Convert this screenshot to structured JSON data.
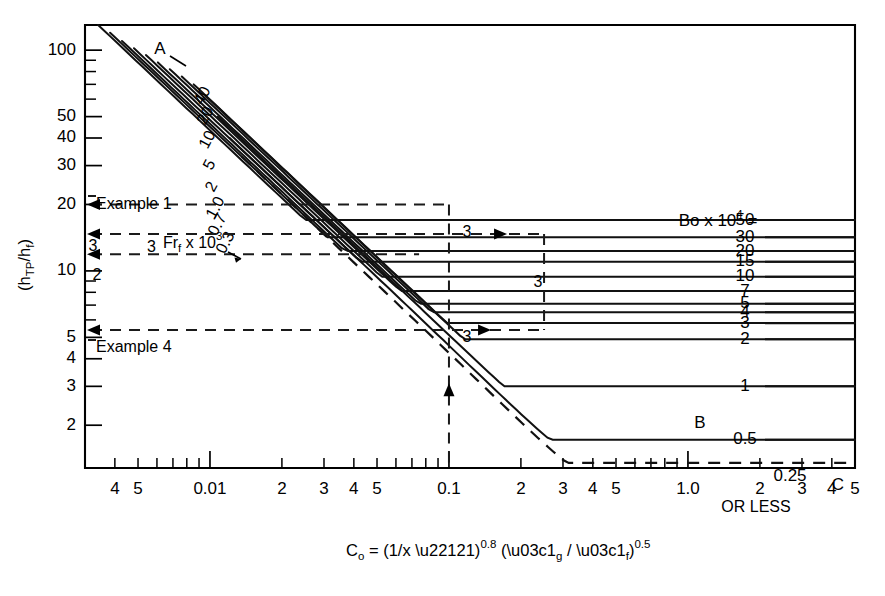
{
  "chart_data": {
    "type": "line",
    "title": "",
    "xlabel": "Cₒ = (1/x −1)⁰·⁸ (ρg / ρf)⁰·⁵",
    "ylabel": "(hTP/hf)",
    "xscale": "log",
    "yscale": "log",
    "xlim": [
      0.003,
      5.0
    ],
    "ylim": [
      1.28,
      130
    ],
    "grid": false,
    "legend_position": "inline-right",
    "x_tick_labels": [
      "4",
      "5",
      "0.01",
      "2",
      "3",
      "4",
      "5",
      "0.1",
      "2",
      "3",
      "4",
      "5",
      "1.0",
      "2",
      "3",
      "4",
      "5"
    ],
    "x_tick_values": [
      0.004,
      0.005,
      0.01,
      0.02,
      0.03,
      0.04,
      0.05,
      0.1,
      0.2,
      0.3,
      0.4,
      0.5,
      1.0,
      2.0,
      3.0,
      4.0,
      5.0
    ],
    "y_tick_labels": [
      "100",
      "50",
      "40",
      "30",
      "20",
      "10",
      "5",
      "4",
      "3",
      "2"
    ],
    "y_tick_values": [
      100,
      50,
      40,
      30,
      20,
      10,
      5,
      4,
      3,
      2
    ],
    "legend_title": "Bo x 10⁴ =",
    "series": [
      {
        "name": "50",
        "label": "50",
        "bo": 50,
        "y_at_left": 130,
        "y_right": 17.0
      },
      {
        "name": "30",
        "label": "30",
        "bo": 30,
        "y_at_left": 120,
        "y_right": 14.2
      },
      {
        "name": "20",
        "label": "20",
        "bo": 20,
        "y_at_left": 110,
        "y_right": 12.3
      },
      {
        "name": "15",
        "label": "15",
        "bo": 15,
        "y_at_left": 102,
        "y_right": 11.0
      },
      {
        "name": "10",
        "label": "10",
        "bo": 10,
        "y_at_left": 95,
        "y_right": 9.4
      },
      {
        "name": "7",
        "label": "7",
        "bo": 7,
        "y_at_left": 88,
        "y_right": 8.1
      },
      {
        "name": "5",
        "label": "5",
        "bo": 5,
        "y_at_left": 82,
        "y_right": 7.1
      },
      {
        "name": "4",
        "label": "4",
        "bo": 4,
        "y_at_left": 76,
        "y_right": 6.5
      },
      {
        "name": "3",
        "label": "3",
        "bo": 3,
        "y_at_left": 70,
        "y_right": 5.8
      },
      {
        "name": "2",
        "label": "2",
        "bo": 2,
        "y_at_left": 62,
        "y_right": 4.9
      },
      {
        "name": "1",
        "label": "1",
        "bo": 1,
        "y_at_left": 50,
        "y_right": 3.0
      },
      {
        "name": "0.5",
        "label": "0.5",
        "bo": 0.5,
        "y_at_left": 40,
        "y_right": 1.72
      },
      {
        "name": "0.25",
        "label": "0.25",
        "bo": 0.25,
        "y_at_left": 33,
        "y_right": 1.35
      }
    ],
    "family_labels": [
      "40",
      "20",
      "10",
      "5",
      "2",
      "1.0",
      "0.7",
      "0.3"
    ],
    "family_title": "Frf x 10³",
    "annotations": [
      {
        "text": "A",
        "x": 0.0072,
        "y": 100
      },
      {
        "text": "B",
        "x": 1.05,
        "y": 2.1
      },
      {
        "text": "C",
        "x": 4.6,
        "y": 1.42
      },
      {
        "text": "OR LESS",
        "x": 2.6,
        "y": 1.3
      },
      {
        "text": "Example 1",
        "x": 0.0055,
        "y": 25
      },
      {
        "text": "Example 4",
        "x": 0.0055,
        "y": 6.4
      },
      {
        "text": "3",
        "x": 0.0038,
        "y": 15
      },
      {
        "text": "2",
        "x": 0.0042,
        "y": 12.5
      }
    ],
    "construction_steps": [
      "3",
      "3",
      "3"
    ],
    "example_readings": [
      {
        "label": "Example 1",
        "htp_over_hf": 20
      },
      {
        "label": "step 3",
        "htp_over_hf": 14.7
      },
      {
        "label": "step 2",
        "htp_over_hf": 11.9
      },
      {
        "label": "Example 4",
        "htp_over_hf": 5.4
      }
    ],
    "vertical_construction_x": [
      0.1,
      0.25
    ]
  },
  "axes": {
    "y_title_main": "(h",
    "y_title_sub1": "TP",
    "y_title_mid": "/h",
    "y_title_sub2": "f",
    "y_title_end": ")",
    "x_title_c": "C",
    "x_title_c_sub": "o",
    "x_title_eq": " = (1/x −1)",
    "x_title_exp1": "0.8",
    "x_title_paren": " (ρ",
    "x_title_rho_g": "g",
    "x_title_slash": " / ρ",
    "x_title_rho_f": "f",
    "x_title_close": ")",
    "x_title_exp2": "0.5"
  },
  "legend": {
    "prefix": "Bo x 10",
    "exponent": "4",
    "equals": "= ",
    "first_value": "50"
  },
  "family": {
    "prefix_num": "3",
    "fr_text": "Fr",
    "fr_sub": "f",
    "fr_mult": " x 10",
    "fr_exp": "3"
  },
  "misc": {
    "or_less": "OR LESS",
    "point_a": "A",
    "point_b": "B",
    "point_c": "C",
    "example1": "Example 1",
    "example4": "Example 4",
    "step_label": "3",
    "step_label_2": "2"
  }
}
